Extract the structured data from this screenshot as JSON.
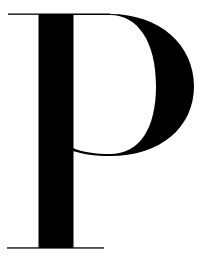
{
  "glyph": {
    "character": "P",
    "style": "high-contrast serif",
    "fill": "#000000",
    "background": "#ffffff"
  }
}
